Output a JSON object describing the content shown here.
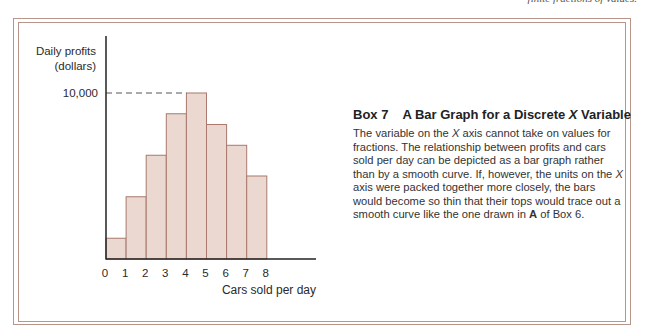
{
  "top_note": "finite fractions of values.",
  "box": {
    "number": "Box 7",
    "title_prefix": "A Bar Graph for a Discrete ",
    "title_var": "X",
    "title_suffix": " Variable",
    "body": [
      {
        "t": "The variable on the "
      },
      {
        "t": "X",
        "i": true
      },
      {
        "t": " axis cannot take on values for fractions. The relationship between profits and cars sold per day can be depicted as a  bar graph rather than by a smooth curve. If, however, the units on the "
      },
      {
        "t": "X",
        "i": true
      },
      {
        "t": " axis were packed together more closely, the bars would become so thin that their tops would trace out a smooth curve like the one drawn in "
      },
      {
        "t": "A",
        "b": true
      },
      {
        "t": " of Box 6."
      }
    ]
  },
  "colors": {
    "frame": "#b8958a",
    "bar_fill": "#ead8d1",
    "bar_stroke": "#a8796c",
    "axis": "#222222",
    "dash": "#555555"
  },
  "chart_data": {
    "type": "bar",
    "title": "",
    "xlabel": "Cars sold per day",
    "ylabel": "Daily profits (dollars)",
    "ylabel_lines": [
      "Daily profits",
      "(dollars)"
    ],
    "x_ticks": [
      "0",
      "1",
      "2",
      "3",
      "4",
      "5",
      "6",
      "7",
      "8"
    ],
    "y_ticks": [
      {
        "value": 10000,
        "label": "10,000"
      }
    ],
    "categories": [
      "0–1",
      "1–2",
      "2–3",
      "3–4",
      "4–5",
      "5–6",
      "6–7",
      "7–8"
    ],
    "values": [
      1250,
      3750,
      6250,
      8750,
      10000,
      8100,
      6850,
      5000
    ],
    "ylim": [
      0,
      10000
    ],
    "annotations": [
      "dashed reference line at 10,000 to top of tallest bar"
    ],
    "grid": false,
    "legend": null
  }
}
